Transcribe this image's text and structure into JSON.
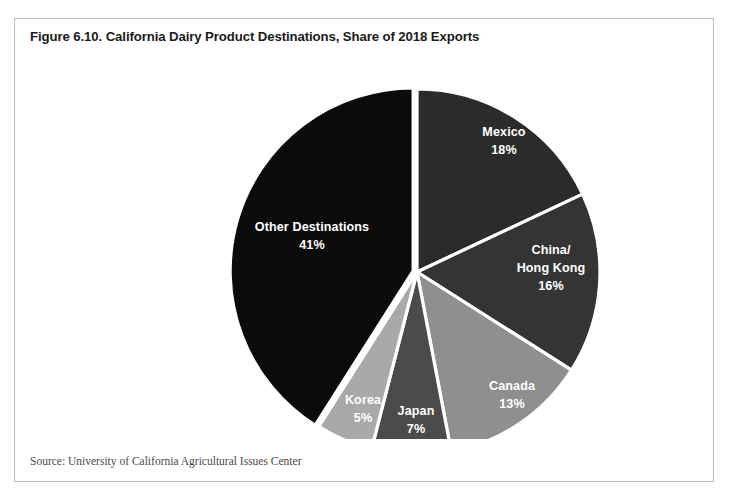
{
  "figure": {
    "title": "Figure 6.10. California Dairy Product Destinations, Share of 2018 Exports",
    "source": "Source: University of California Agricultural Issues Center"
  },
  "chart_data": {
    "type": "pie",
    "title": "Figure 6.10. California Dairy Product Destinations, Share of 2018 Exports",
    "xlabel": "",
    "ylabel": "",
    "units": "percent share of 2018 exports",
    "start_angle_deg": 0,
    "direction": "clockwise",
    "legend": "none",
    "labels_inside_slices": true,
    "separator_color": "#ffffff",
    "categories": [
      "Mexico",
      "China/ Hong Kong",
      "Canada",
      "Japan",
      "Korea",
      "Other Destinations"
    ],
    "values": [
      18,
      16,
      13,
      7,
      5,
      41
    ],
    "slices": [
      {
        "name": "Mexico",
        "label_lines": [
          "Mexico"
        ],
        "value": 18,
        "value_label": "18%",
        "color": "#2b2b2b",
        "exploded": false,
        "label_x": 489,
        "label_y": 93
      },
      {
        "name": "China/Hong Kong",
        "label_lines": [
          "China/",
          "Hong Kong"
        ],
        "value": 16,
        "value_label": "16%",
        "color": "#343434",
        "exploded": false,
        "label_x": 536,
        "label_y": 220
      },
      {
        "name": "Canada",
        "label_lines": [
          "Canada"
        ],
        "value": 13,
        "value_label": "13%",
        "color": "#8f8f8f",
        "exploded": false,
        "label_x": 497,
        "label_y": 347
      },
      {
        "name": "Japan",
        "label_lines": [
          "Japan"
        ],
        "value": 7,
        "value_label": "7%",
        "color": "#4b4b4b",
        "exploded": false,
        "label_x": 401,
        "label_y": 372
      },
      {
        "name": "Korea",
        "label_lines": [
          "Korea"
        ],
        "value": 5,
        "value_label": "5%",
        "color": "#a9a9a9",
        "exploded": false,
        "label_x": 348,
        "label_y": 361
      },
      {
        "name": "Other Destinations",
        "label_lines": [
          "Other Destinations"
        ],
        "value": 41,
        "value_label": "41%",
        "color": "#0b0b0b",
        "exploded": true,
        "label_x": 297,
        "label_y": 188
      }
    ],
    "geometry": {
      "center_x": 402,
      "center_y": 223,
      "radius": 183,
      "explode_offset": 4
    }
  }
}
